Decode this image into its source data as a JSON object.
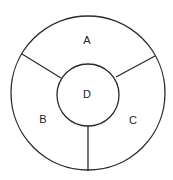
{
  "diagram": {
    "type": "concentric-regions",
    "outer_circle": {
      "cx": 88,
      "cy": 93,
      "r": 77
    },
    "inner_circle": {
      "cx": 88,
      "cy": 95,
      "r": 31
    },
    "colors": {
      "stroke": "#2a2a2a",
      "text": "#222222",
      "background": "#ffffff"
    },
    "regions": [
      {
        "id": "A",
        "label": "A",
        "x": 87,
        "y": 41
      },
      {
        "id": "B",
        "label": "B",
        "x": 43,
        "y": 119
      },
      {
        "id": "C",
        "label": "C",
        "x": 133,
        "y": 120
      },
      {
        "id": "D",
        "label": "D",
        "x": 87,
        "y": 95
      }
    ]
  }
}
